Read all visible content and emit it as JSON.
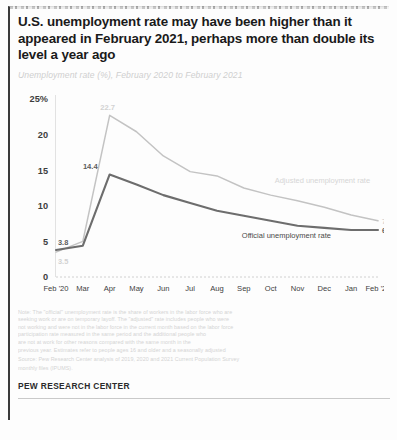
{
  "report": {
    "title": "U.S. unemployment rate may have been higher than it appeared in February 2021, perhaps more than double its level a year ago",
    "subtitle": "Unemployment rate (%), February 2020 to February 2021",
    "brand": "PEW RESEARCH CENTER",
    "notes": [
      "Note: The \"official\" unemployment rate is the share of workers in the labor force who are",
      "seeking work or are on temporary layoff. The \"adjusted\" rate includes people who were",
      "not working and were not in the labor force in the current month based on the labor force",
      "participation rate measured in the same period and the additional people who",
      "are not at work for other reasons compared with the same month in the"
    ],
    "sources": [
      "previous year. Estimates refer to people ages 16 and older and a seasonally adjusted",
      "Source: Pew Research Center analysis of 2019, 2020 and 2021 Current Population Survey",
      "monthly files (IPUMS)."
    ]
  },
  "chart_data": {
    "type": "line",
    "title": "U.S. unemployment rate may have been higher than it appeared in February 2021, perhaps more than double its level a year ago",
    "subtitle": "Unemployment rate (%), February 2020 to February 2021",
    "xlabel": "",
    "ylabel": "Unemployment rate (%)",
    "ylim": [
      0,
      25
    ],
    "yticks": [
      0,
      5,
      10,
      15,
      20,
      25
    ],
    "ytick_labels": [
      "0",
      "5",
      "10",
      "15",
      "20",
      "25%"
    ],
    "grid": false,
    "legend": "inline-annotations",
    "categories": [
      "Feb '20",
      "Mar",
      "Apr",
      "May",
      "Jun",
      "Jul",
      "Aug",
      "Sep",
      "Oct",
      "Nov",
      "Dec",
      "Jan",
      "Feb '21"
    ],
    "series": [
      {
        "name": "Adjusted unemployment rate",
        "color": "#c3c3c3",
        "values": [
          3.5,
          5.0,
          22.7,
          20.4,
          17.0,
          14.8,
          14.2,
          12.5,
          11.5,
          10.7,
          9.8,
          8.7,
          7.9
        ],
        "start_label": "3.5",
        "peak_label": "22.7",
        "end_label": "7.9",
        "annotation": "Adjusted unemployment rate"
      },
      {
        "name": "Official unemployment rate",
        "color": "#6d6d6d",
        "values": [
          3.8,
          4.4,
          14.4,
          13.0,
          11.5,
          10.4,
          9.3,
          8.6,
          7.9,
          7.2,
          6.9,
          6.6,
          6.6
        ],
        "start_label": "3.8",
        "peak_label": "14.4",
        "end_label": "6.6",
        "annotation": "Official unemployment rate"
      }
    ]
  }
}
